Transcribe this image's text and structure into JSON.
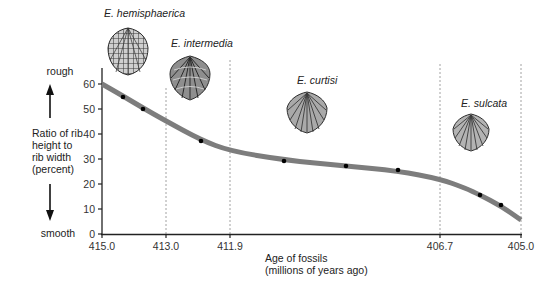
{
  "chart_data": {
    "type": "line",
    "title": "",
    "xlabel": "Age of fossils (millions of years ago)",
    "xlabel_lines": [
      "Age of fossils",
      "(millions of years ago)"
    ],
    "ylabel": "Ratio of rib height to rib width (percent)",
    "ylabel_lines": [
      "Ratio of rib",
      "height to",
      "rib width",
      "(percent)"
    ],
    "y_high_label": "rough",
    "y_low_label": "smooth",
    "ylim": [
      0,
      60
    ],
    "yticks": [
      0,
      10,
      20,
      30,
      40,
      50,
      60
    ],
    "xticks": [
      "415.0",
      "413.0",
      "411.9",
      "406.7",
      "405.0"
    ],
    "x_axis_reversed": true,
    "grid": false,
    "boundaries": [
      "413.0",
      "411.9",
      "406.7",
      "405.0"
    ],
    "species": [
      {
        "name": "E. hemisphaerica",
        "interval": [
          "415.0",
          "413.0"
        ]
      },
      {
        "name": "E. intermedia",
        "interval": [
          "413.0",
          "411.9"
        ]
      },
      {
        "name": "E. curtisi",
        "interval": [
          "411.9",
          "406.7"
        ]
      },
      {
        "name": "E. sulcata",
        "interval": [
          "406.7",
          "405.0"
        ]
      }
    ],
    "series": [
      {
        "name": "trend",
        "style": "smooth-curve",
        "x": [
          415.0,
          413.0,
          411.9,
          406.7,
          405.0
        ],
        "values": [
          60,
          45,
          33,
          22,
          6
        ]
      },
      {
        "name": "fossil samples",
        "style": "points",
        "x": [
          414.35,
          413.7,
          412.5,
          410.5,
          409.0,
          407.7,
          405.8,
          405.4
        ],
        "values": [
          55,
          50,
          37,
          29,
          27,
          25.5,
          15.5,
          11.5
        ]
      }
    ]
  }
}
